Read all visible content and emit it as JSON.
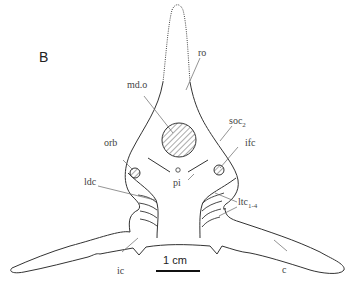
{
  "figure": {
    "panel_label": "B",
    "labels": {
      "ro": "ro",
      "md_o": "md.o",
      "soc": "soc",
      "soc_sub": "2",
      "orb": "orb",
      "ifc": "ifc",
      "pi": "pi",
      "ldc": "ldc",
      "ltc": "ltc",
      "ltc_sub": "1-4",
      "ic": "ic",
      "c": "c"
    },
    "scale_bar": {
      "label": "1 cm"
    },
    "colors": {
      "line": "#333333",
      "hatch": "#555555",
      "background": "#ffffff"
    }
  }
}
